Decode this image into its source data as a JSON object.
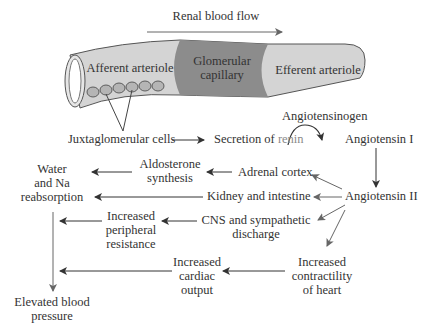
{
  "diagram": {
    "flow_label": "Renal blood flow",
    "vessel": {
      "afferent": "Afferent arteriole",
      "glomerular_line1": "Glomerular",
      "glomerular_line2": "capillary",
      "efferent": "Efferent arteriole"
    },
    "nodes": {
      "jg_cells": "Juxtaglomerular cells",
      "secretion": "Secretion of",
      "renin": "renin",
      "angiotensinogen": "Angiotensinogen",
      "angiotensin1": "Angiotensin I",
      "angiotensin2": "Angiotensin II",
      "adrenal": "Adrenal cortex",
      "aldo_line1": "Aldosterone",
      "aldo_line2": "synthesis",
      "kidney": "Kidney and intestine",
      "water_line1": "Water",
      "water_line2": "and Na",
      "water_line3": "reabsorption",
      "cns_line1": "CNS and sympathetic",
      "cns_line2": "discharge",
      "periph_line1": "Increased",
      "periph_line2": "peripheral",
      "periph_line3": "resistance",
      "contract_line1": "Increased",
      "contract_line2": "contractility",
      "contract_line3": "of heart",
      "cardiac_line1": "Increased",
      "cardiac_line2": "cardiac",
      "cardiac_line3": "output",
      "bp_line1": "Elevated blood",
      "bp_line2": "pressure"
    },
    "colors": {
      "vessel_light": "#d4d4d4",
      "vessel_dark": "#8c8c8c",
      "cells": "#b5b5b5",
      "arrow": "#444444",
      "arrow_gray": "#777777",
      "renin": "#8a8a8a"
    }
  }
}
